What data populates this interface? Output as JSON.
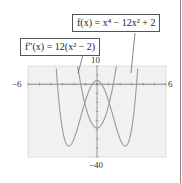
{
  "chart_data": {
    "type": "line",
    "title": "",
    "xlabel": "",
    "ylabel": "",
    "xlim": [
      -6,
      6
    ],
    "ylim": [
      -40,
      10
    ],
    "tick_labels": {
      "x_min": "−6",
      "x_max": "6",
      "y_max": "10",
      "y_min": "−40"
    },
    "grid": false,
    "series": [
      {
        "name": "f(x) = x⁴ − 12x² + 2",
        "expression": "x^4 - 12x^2 + 2",
        "points": [
          [
            -3.8,
            37.4
          ],
          [
            -3.5,
            -11.9
          ],
          [
            -3,
            -25
          ],
          [
            -2.45,
            -34
          ],
          [
            -2,
            -30
          ],
          [
            -1,
            -9
          ],
          [
            0,
            2
          ],
          [
            1,
            -9
          ],
          [
            2,
            -30
          ],
          [
            2.45,
            -34
          ],
          [
            3,
            -25
          ],
          [
            3.5,
            -11.9
          ],
          [
            3.8,
            37.4
          ]
        ]
      },
      {
        "name": "f″(x) = 12(x² − 2)",
        "expression": "12(x^2 - 2)",
        "points": [
          [
            -1.8,
            14.9
          ],
          [
            -1.5,
            3
          ],
          [
            -1,
            -12
          ],
          [
            0,
            -24
          ],
          [
            1,
            -12
          ],
          [
            1.5,
            3
          ],
          [
            1.8,
            14.9
          ]
        ]
      }
    ],
    "annotations": [
      {
        "text": "f(x) = x⁴ − 12x² + 2",
        "points_to": "right branch of f"
      },
      {
        "text": "f″(x) = 12(x² − 2)",
        "points_to": "left branch of f″"
      }
    ]
  },
  "labels": {
    "f_label": "f(x) = x⁴ − 12x² + 2",
    "fpp_label": "f″(x) = 12(x² − 2)",
    "y_max": "10",
    "y_min": "−40",
    "x_min": "−6",
    "x_max": "6"
  }
}
